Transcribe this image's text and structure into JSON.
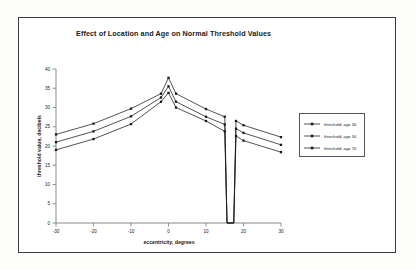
{
  "chart_data": {
    "type": "line",
    "title": "Effect of  Location and Age on Normal Threshold Values",
    "xlabel": "eccentricity, degrees",
    "ylabel": "threshold value, decibels",
    "xlim": [
      -30,
      30
    ],
    "ylim": [
      0,
      40
    ],
    "xticks": [
      -30,
      -20,
      -10,
      0,
      10,
      20,
      30
    ],
    "yticks": [
      0,
      5,
      10,
      15,
      20,
      25,
      30,
      35,
      40
    ],
    "xtick_labels": [
      "-30",
      "-20",
      "-10",
      "0",
      "10",
      "20",
      "30"
    ],
    "ytick_labels": [
      "0",
      "5",
      "10",
      "15",
      "20",
      "25",
      "30",
      "35",
      "40"
    ],
    "grid": false,
    "legend_position": "right",
    "marker": "square",
    "color": "#1a1a1a",
    "series": [
      {
        "name": "threshold, age 30",
        "x": [
          -30,
          -20,
          -10,
          -2,
          0,
          2,
          10,
          15,
          15.6,
          17.4,
          18,
          20,
          30
        ],
        "values": [
          23.0,
          25.8,
          29.7,
          33.6,
          37.7,
          33.6,
          29.6,
          27.6,
          0,
          0,
          26.5,
          25.4,
          22.3
        ]
      },
      {
        "name": "threshold, age 50",
        "x": [
          -30,
          -20,
          -10,
          -2,
          0,
          2,
          10,
          15,
          15.6,
          17.4,
          18,
          20,
          30
        ],
        "values": [
          21.0,
          23.8,
          27.7,
          32.6,
          35.5,
          31.5,
          27.6,
          25.6,
          0,
          0,
          24.5,
          23.4,
          20.3
        ]
      },
      {
        "name": "threshold, age 70",
        "x": [
          -30,
          -20,
          -10,
          -2,
          0,
          2,
          10,
          15,
          15.6,
          17.4,
          18,
          20,
          30
        ],
        "values": [
          19.0,
          21.8,
          25.7,
          31.5,
          33.8,
          30.0,
          26.5,
          23.8,
          0,
          0,
          22.6,
          21.4,
          18.4
        ]
      }
    ]
  }
}
